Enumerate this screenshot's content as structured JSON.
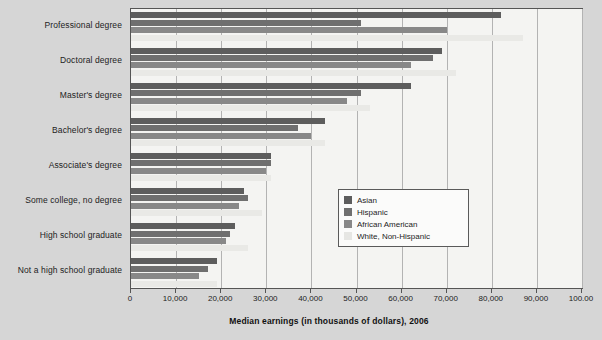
{
  "chart_data": {
    "type": "bar",
    "orientation": "horizontal",
    "title": "",
    "xlabel": "Median earnings (in thousands of dollars), 2006",
    "ylabel": "",
    "xlim": [
      0,
      100000
    ],
    "xticks": [
      0,
      10000,
      20000,
      30000,
      40000,
      50000,
      60000,
      70000,
      80000,
      90000,
      100000
    ],
    "xticklabels": [
      "0",
      "10,000",
      "20,000",
      "30,000",
      "40,000",
      "50,000",
      "60,000",
      "70,000",
      "80,000",
      "90,000",
      "100.00"
    ],
    "grid": true,
    "legend_position": "center-right",
    "categories": [
      "Professional degree",
      "Doctoral degree",
      "Master's degree",
      "Bachelor's degree",
      "Associate's degree",
      "Some college, no degree",
      "High school graduate",
      "Not a high school graduate"
    ],
    "series": [
      {
        "name": "Asian",
        "color": "#5d5d5d",
        "values": [
          82000,
          69000,
          62000,
          43000,
          31000,
          25000,
          23000,
          19000
        ]
      },
      {
        "name": "Hispanic",
        "color": "#6f6f6f",
        "values": [
          51000,
          67000,
          51000,
          37000,
          31000,
          26000,
          22000,
          17000
        ]
      },
      {
        "name": "African American",
        "color": "#888888",
        "values": [
          70000,
          62000,
          48000,
          40000,
          30000,
          24000,
          21000,
          15000
        ]
      },
      {
        "name": "White, Non-Hispanic",
        "color": "#e9e9e6",
        "values": [
          87000,
          72000,
          53000,
          43000,
          31000,
          29000,
          26000,
          19000
        ]
      }
    ]
  },
  "legend": {
    "items": [
      {
        "label": "Asian"
      },
      {
        "label": "Hispanic"
      },
      {
        "label": "African American"
      },
      {
        "label": "White, Non-Hispanic"
      }
    ]
  }
}
